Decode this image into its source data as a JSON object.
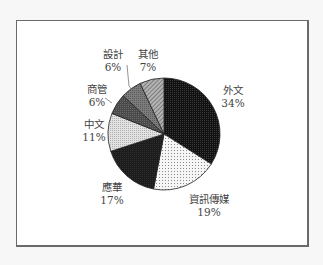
{
  "chart_data": {
    "type": "pie",
    "title": "",
    "start_angle_deg": 0,
    "direction": "clockwise",
    "categories": [
      "外文",
      "資訊傳媒",
      "應華",
      "中文",
      "商管",
      "設計",
      "其他"
    ],
    "values": [
      34,
      19,
      17,
      11,
      6,
      6,
      7
    ],
    "value_labels": [
      "34%",
      "19%",
      "17%",
      "11%",
      "6%",
      "6%",
      "7%"
    ],
    "fills": [
      "#111111",
      "#f4f4f4",
      "#1a1a1a",
      "#d8d8d8",
      "#555555",
      "#7a7a7a",
      "#a8a8a8"
    ],
    "legend": "none (data labels outside slices)",
    "slices": [
      {
        "label": "外文",
        "value": 34,
        "value_label": "34%",
        "fill": "#111111",
        "pattern": "dense-dots"
      },
      {
        "label": "資訊傳媒",
        "value": 19,
        "value_label": "19%",
        "fill": "#f4f4f4",
        "pattern": "sparse-dots"
      },
      {
        "label": "應華",
        "value": 17,
        "value_label": "17%",
        "fill": "#1a1a1a",
        "pattern": "solid-dark"
      },
      {
        "label": "中文",
        "value": 11,
        "value_label": "11%",
        "fill": "#d8d8d8",
        "pattern": "light-dots"
      },
      {
        "label": "商管",
        "value": 6,
        "value_label": "6%",
        "fill": "#555555",
        "pattern": "dark-gray"
      },
      {
        "label": "設計",
        "value": 6,
        "value_label": "6%",
        "fill": "#7a7a7a",
        "pattern": "medium-gray"
      },
      {
        "label": "其他",
        "value": 7,
        "value_label": "7%",
        "fill": "#a8a8a8",
        "pattern": "hatched"
      }
    ]
  },
  "labels": {
    "waiwen": {
      "name": "外文",
      "pct": "34%"
    },
    "zixun": {
      "name": "資訊傳媒",
      "pct": "19%"
    },
    "yinghua": {
      "name": "應華",
      "pct": "17%"
    },
    "zhongwen": {
      "name": "中文",
      "pct": "11%"
    },
    "shangguan": {
      "name": "商管",
      "pct": "6%"
    },
    "sheji": {
      "name": "設計",
      "pct": "6%"
    },
    "qita": {
      "name": "其他",
      "pct": "7%"
    }
  }
}
